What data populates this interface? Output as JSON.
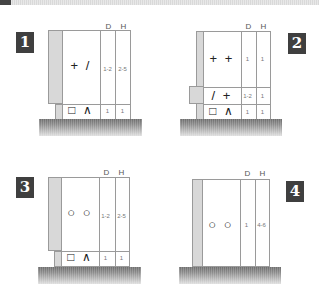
{
  "header": {
    "bar": "top-gradient-bar"
  },
  "panels": [
    {
      "badge": "1",
      "col_headers": {
        "d": "D",
        "h": "H"
      },
      "rows": [
        {
          "symbols": "+ /",
          "d": "1-2",
          "h": "2-5"
        },
        {
          "symbols": "□ ∧",
          "d": "1",
          "h": "1"
        }
      ]
    },
    {
      "badge": "2",
      "col_headers": {
        "d": "D",
        "h": "H"
      },
      "rows": [
        {
          "symbols": "+ +",
          "d": "1",
          "h": "1"
        },
        {
          "symbols": "/ +",
          "d": "1-2",
          "h": "1"
        },
        {
          "symbols": "□ ∧",
          "d": "1",
          "h": "1"
        }
      ]
    },
    {
      "badge": "3",
      "col_headers": {
        "d": "D",
        "h": "H"
      },
      "rows": [
        {
          "symbols": "○ ○",
          "d": "1-2",
          "h": "2-5"
        },
        {
          "symbols": "□ ∧",
          "d": "1",
          "h": "1"
        }
      ]
    },
    {
      "badge": "4",
      "col_headers": {
        "d": "D",
        "h": "H"
      },
      "rows": [
        {
          "symbols": "○ ○",
          "d": "1",
          "h": "4-6"
        }
      ]
    }
  ],
  "colors": {
    "badge_bg": "#3f3f3f",
    "strip": "#d8d8d8",
    "ground": "#7a7a7a",
    "line": "#9a9a9a"
  }
}
